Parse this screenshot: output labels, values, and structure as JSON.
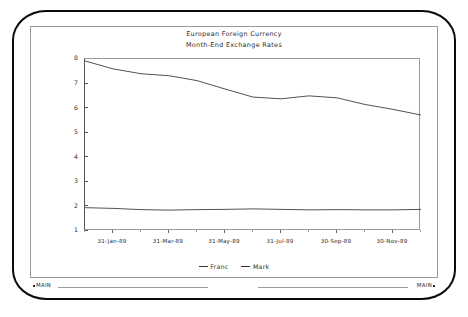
{
  "window": {
    "bezel_style": "crt-rounded-frame",
    "status_left": "MAIN",
    "status_right": "MAIN"
  },
  "chart_data": {
    "type": "line",
    "title": "European Foreign Currency",
    "subtitle": "Month-End Exchange Rates",
    "xlabel": "",
    "ylabel": "Foreign Currency Per US Dollar",
    "ylim": [
      1,
      8
    ],
    "yticks": [
      1,
      2,
      3,
      4,
      5,
      6,
      7,
      8
    ],
    "ytick_labels": [
      "1",
      "2",
      "3",
      "4",
      "5",
      "6",
      "7",
      "8"
    ],
    "grid": false,
    "legend_position": "bottom-center",
    "x": [
      "31-Dec-88",
      "31-Jan-89",
      "28-Feb-89",
      "31-Mar-89",
      "30-Apr-89",
      "31-May-89",
      "30-Jun-89",
      "31-Jul-89",
      "31-Aug-89",
      "30-Sep-89",
      "31-Oct-89",
      "30-Nov-89",
      "31-Dec-89"
    ],
    "xtick_labels": [
      "31-Jan-89",
      "31-Mar-89",
      "31-May-89",
      "31-Jul-89",
      "30-Sep-89",
      "30-Nov-89"
    ],
    "xtick_index": [
      1,
      3,
      5,
      7,
      9,
      11
    ],
    "series": [
      {
        "name": "Franc",
        "color": "#333333",
        "values": [
          7.92,
          7.6,
          7.4,
          7.32,
          7.12,
          6.78,
          6.45,
          6.38,
          6.5,
          6.42,
          6.15,
          5.95,
          5.72
        ]
      },
      {
        "name": "Mark",
        "color": "#333333",
        "values": [
          1.95,
          1.92,
          1.87,
          1.85,
          1.87,
          1.88,
          1.9,
          1.88,
          1.86,
          1.87,
          1.86,
          1.86,
          1.88
        ]
      }
    ]
  }
}
